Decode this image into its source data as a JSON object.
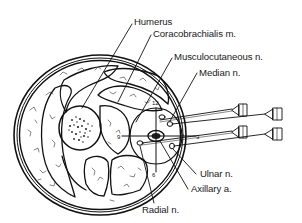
{
  "figure": {
    "type": "cross-section anatomical diagram",
    "line_color": "#111111",
    "background": "#ffffff"
  },
  "labels": [
    {
      "id": "humerus",
      "text": "Humerus"
    },
    {
      "id": "coracobrachialis",
      "text": "Coracobrachialis m."
    },
    {
      "id": "musculocutaneous",
      "text": "Musculocutaneous n."
    },
    {
      "id": "median",
      "text": "Median n."
    },
    {
      "id": "ulnar",
      "text": "Ulnar n."
    },
    {
      "id": "axillary",
      "text": "Axillary a."
    },
    {
      "id": "radial",
      "text": "Radial n."
    }
  ],
  "clock_marks": {
    "twelve": "12",
    "three": "3",
    "six": "6",
    "nine": "9"
  },
  "needles": [
    {
      "id": "needle-1"
    },
    {
      "id": "needle-2"
    },
    {
      "id": "needle-3"
    },
    {
      "id": "needle-4"
    }
  ]
}
